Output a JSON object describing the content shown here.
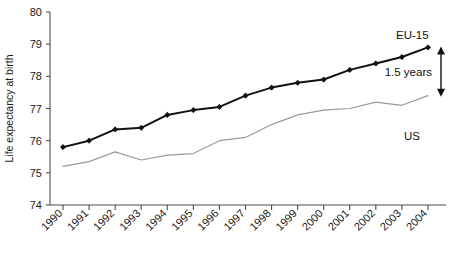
{
  "chart_data": {
    "type": "line",
    "title": "",
    "xlabel": "",
    "ylabel": "Life expectancy at birth",
    "ylim": [
      74,
      80
    ],
    "yticks": [
      74,
      75,
      76,
      77,
      78,
      79,
      80
    ],
    "grid": false,
    "legend_position": "inline-right",
    "categories": [
      "1990",
      "1991",
      "1992",
      "1993",
      "1994",
      "1995",
      "1996",
      "1997",
      "1998",
      "1999",
      "2000",
      "2001",
      "2002",
      "2003",
      "2004"
    ],
    "series": [
      {
        "name": "EU-15",
        "color": "#111111",
        "marker": "diamond",
        "line_width": 2.0,
        "values": [
          75.8,
          76.0,
          76.35,
          76.4,
          76.8,
          76.95,
          77.05,
          77.4,
          77.65,
          77.8,
          77.9,
          78.2,
          78.4,
          78.6,
          78.9
        ]
      },
      {
        "name": "US",
        "color": "#9a9a9a",
        "marker": "none",
        "line_width": 1.2,
        "values": [
          75.2,
          75.35,
          75.65,
          75.4,
          75.55,
          75.6,
          76.0,
          76.1,
          76.5,
          76.8,
          76.95,
          77.0,
          77.2,
          77.1,
          77.4
        ]
      }
    ],
    "annotations": [
      {
        "id": "gap-arrow",
        "text": "1.5 years",
        "type": "double-headed-arrow",
        "at_year": "2004",
        "from_value": 78.9,
        "to_value": 77.4
      }
    ]
  },
  "labels": {
    "series_eu15": "EU-15",
    "series_us": "US",
    "gap_text": "1.5 years",
    "y_axis_title": "Life expectancy at birth"
  }
}
